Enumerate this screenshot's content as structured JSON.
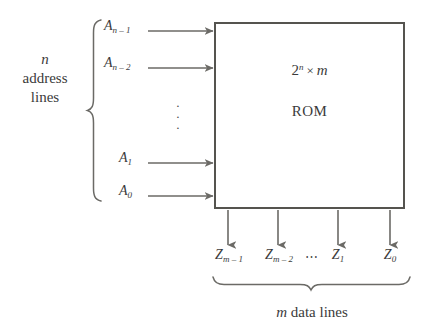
{
  "diagram": {
    "colors": {
      "background": "#ffffff",
      "stroke": "#55544f",
      "arrow": "#6b6a66",
      "text": "#3b3b3b"
    },
    "rom_box": {
      "capacity_base": "2",
      "capacity_exponent": "n",
      "capacity_times": "×",
      "capacity_width": "m",
      "name": "ROM"
    },
    "address_group": {
      "count_symbol": "n",
      "label_line_1": "n",
      "label_line_2": "address",
      "label_line_3": "lines",
      "vertical_ellipsis": "⋮",
      "lines": [
        {
          "base": "A",
          "index": "n – 1"
        },
        {
          "base": "A",
          "index": "n – 2"
        },
        {
          "base": "A",
          "index": "1"
        },
        {
          "base": "A",
          "index": "0"
        }
      ]
    },
    "data_group": {
      "caption_symbol": "m",
      "caption_text": "data lines",
      "horizontal_ellipsis": "⋯",
      "lines": [
        {
          "base": "Z",
          "index": "m – 1"
        },
        {
          "base": "Z",
          "index": "m – 2"
        },
        {
          "base": "Z",
          "index": "1"
        },
        {
          "base": "Z",
          "index": "0"
        }
      ]
    },
    "icons": {
      "left_brace": "left-curly-brace",
      "bottom_brace": "bottom-curly-brace",
      "input_arrow": "arrow-right",
      "output_arrow": "arrow-down"
    }
  }
}
